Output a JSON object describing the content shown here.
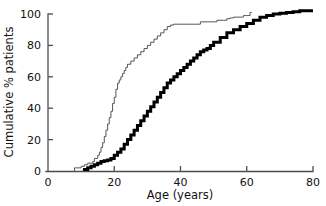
{
  "chart_data": {
    "type": "line",
    "subtype": "cumulative-step-ecdf",
    "title": "",
    "xlabel": "Age (years)",
    "ylabel": "Cumulative % patients",
    "xlim": [
      0,
      80
    ],
    "ylim": [
      0,
      100
    ],
    "xticks": [
      0,
      20,
      40,
      60,
      80
    ],
    "yticks": [
      0,
      20,
      40,
      60,
      80,
      100
    ],
    "xtick_labels": [
      "0",
      "20",
      "40",
      "60",
      "80"
    ],
    "ytick_labels": [
      "0",
      "20",
      "40",
      "60",
      "80",
      "100"
    ],
    "grid": false,
    "legend": false,
    "legend_position": "none",
    "tick_direction": "in",
    "spines": [
      "left",
      "bottom"
    ],
    "series": [
      {
        "name": "thin-curve",
        "style": "thin",
        "color": "#555555",
        "linewidth": 1,
        "x": [
          8,
          8,
          9,
          10,
          11,
          12,
          13,
          13.5,
          14,
          15,
          15.5,
          16,
          16.5,
          17,
          17.5,
          18,
          18.5,
          19,
          19.5,
          20,
          20.5,
          21,
          21.5,
          22,
          22.5,
          23,
          23.5,
          24,
          25,
          26,
          27,
          28,
          29,
          30,
          31,
          32,
          33,
          34,
          35,
          36,
          37,
          38,
          44,
          46,
          50,
          51,
          53,
          54,
          55,
          56,
          58,
          59,
          60,
          61,
          61.5
        ],
        "y": [
          0,
          2,
          2,
          3,
          4,
          5,
          5,
          6,
          8,
          10,
          12,
          15,
          18,
          22,
          26,
          30,
          34,
          38,
          43,
          47,
          52,
          56,
          58,
          60,
          62,
          64,
          66,
          68,
          70,
          72,
          74,
          76,
          78,
          80,
          82,
          84,
          86,
          88,
          90,
          92,
          93,
          93.5,
          93.5,
          95,
          95,
          96,
          96,
          97,
          97.5,
          98,
          98,
          99,
          99,
          101,
          101
        ]
      },
      {
        "name": "thick-curve",
        "style": "thick",
        "color": "#000000",
        "linewidth": 3,
        "x": [
          11,
          11,
          12,
          13,
          14,
          15,
          16,
          17,
          18,
          19,
          20,
          21,
          22,
          23,
          24,
          25,
          26,
          27,
          28,
          29,
          30,
          31,
          32,
          33,
          34,
          35,
          36,
          37,
          38,
          39,
          40,
          41,
          42,
          43,
          44,
          45,
          46,
          47,
          48,
          49,
          50,
          52,
          54,
          56,
          58,
          60,
          62,
          64,
          66,
          68,
          70,
          72,
          74,
          76,
          78,
          80
        ],
        "y": [
          0,
          1,
          2,
          3,
          4,
          5,
          6,
          6.5,
          7,
          8,
          10,
          12,
          14,
          17,
          20,
          23,
          26,
          29,
          32,
          35,
          38,
          41,
          44,
          47,
          50,
          53,
          56,
          58,
          60,
          62,
          64,
          66,
          68,
          70,
          72,
          74,
          76,
          77,
          78,
          80,
          82,
          85,
          88,
          90,
          92,
          94,
          96,
          98,
          99,
          100,
          100.5,
          101,
          101.5,
          102,
          102,
          102
        ]
      }
    ],
    "annotations": [],
    "notes": {
      "thin_start_age": 8,
      "thick_start_age": 11,
      "thin_end_age": 61.5,
      "thick_end_age": 80,
      "thin_plateau_percent": 93.5,
      "thin_final_percent": 101,
      "thick_final_percent": 102
    }
  },
  "axes": {
    "x_title": "Age (years)",
    "y_title": "Cumulative % patients"
  }
}
